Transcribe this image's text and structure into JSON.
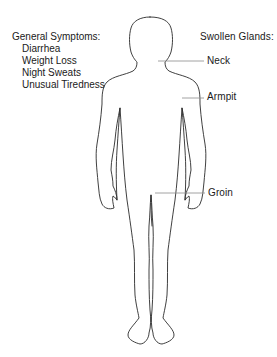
{
  "diagram": {
    "colors": {
      "line": "#2a2a2a",
      "leader_line": "#8a8a8a",
      "text": "#1a1a1a",
      "background": "#ffffff"
    }
  },
  "general_symptoms": {
    "heading": "General Symptoms:",
    "items": [
      "Diarrhea",
      "Weight Loss",
      "Night Sweats",
      "Unusual Tiredness"
    ]
  },
  "swollen_glands": {
    "heading": "Swollen Glands:",
    "locations": [
      {
        "label": "Neck"
      },
      {
        "label": "Armpit"
      },
      {
        "label": "Groin"
      }
    ]
  }
}
